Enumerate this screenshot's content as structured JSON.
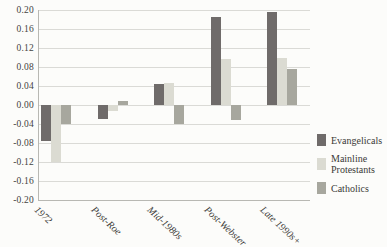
{
  "chart_data": {
    "type": "bar",
    "title": "",
    "xlabel": "",
    "ylabel": "",
    "categories": [
      "1972",
      "Post-Roe",
      "Mid-1980s",
      "Post-Webster",
      "Late 1990s+"
    ],
    "series": [
      {
        "name": "Evangelicals",
        "color": "#6f6b6a",
        "values": [
          -0.075,
          -0.03,
          0.045,
          0.185,
          0.195
        ]
      },
      {
        "name": "Mainline Protestants",
        "color": "#dbdbd2",
        "values": [
          -0.12,
          -0.012,
          0.047,
          0.096,
          0.098
        ]
      },
      {
        "name": "Catholics",
        "color": "#a7a79e",
        "values": [
          -0.04,
          0.008,
          -0.04,
          -0.032,
          0.076
        ]
      }
    ],
    "legend_lines": [
      [
        "Evangelicals"
      ],
      [
        "Mainline",
        "Protestants"
      ],
      [
        "Catholics"
      ]
    ],
    "y_axis": {
      "min": -0.2,
      "max": 0.2,
      "tick_step": 0.04,
      "tick_labels": [
        "0.20",
        "0.16",
        "0.12",
        "0.08",
        "0.04",
        "0.00",
        "-0.04",
        "-0.08",
        "-0.12",
        "-0.16",
        "-0.20"
      ]
    },
    "grid": true,
    "legend_position": "right",
    "x_tick_rotation_deg": 43
  },
  "colors": {
    "background": "#fcfcfa",
    "gridline": "#dadad6",
    "axis_line": "#b8b8b3",
    "tick_text": "#44433f",
    "label_text": "#3b3a37"
  }
}
